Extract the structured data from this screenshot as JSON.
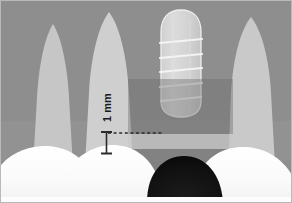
{
  "figure": {
    "name": "dental-periapical-radiograph-illustration",
    "width": 292,
    "height": 203,
    "border_color": "#b9b9b9",
    "background_color": "#ffffff"
  },
  "annotations": {
    "measurement_label": "1 mm",
    "measurement_label_rotation_deg": -90,
    "measurement_label_color": "#1a1a1a",
    "measurement_bar": {
      "name": "vertical-measure-bar",
      "x": 105,
      "y_top": 131,
      "y_bottom": 153,
      "cap_width": 11,
      "color": "#2b2b2b"
    },
    "reference_line": {
      "name": "dashed-reference-line",
      "style": "dashed",
      "x_start": 107,
      "x_end": 161,
      "y": 132,
      "color": "#2b2b2b"
    }
  },
  "anatomy": {
    "background_bone": {
      "name": "alveolar-bone-background",
      "color": "#8e8e8e"
    },
    "tooth_roots": [
      {
        "name": "root-left-outer",
        "color": "#c6c6c6"
      },
      {
        "name": "root-left-inner",
        "color": "#cfcfcf"
      },
      {
        "name": "root-right-outer",
        "color": "#c9c9c9"
      }
    ],
    "crowns": {
      "name": "tooth-crowns-row",
      "color": "#fbfbfb",
      "count": 4
    },
    "dark_dome": {
      "name": "radiolucent-dark-dome",
      "color": "#111111"
    }
  },
  "implant": {
    "name": "dental-implant-fixture",
    "body_color": "#d6d6d6",
    "outline_color": "#efefef",
    "thread_color": "#f2f2f2",
    "thread_count": 5,
    "top_shape": "rounded-dome",
    "x": 159,
    "y": 9,
    "width": 42,
    "height": 105
  },
  "overlays": [
    {
      "name": "graft-region-overlay",
      "shape": "rectangle",
      "color": "#6d6d6d",
      "opacity": 0.42,
      "x": 127,
      "y": 78,
      "width": 105,
      "height": 96
    },
    {
      "name": "bone-level-band-overlay",
      "shape": "rectangle",
      "color": "#e8e8e8",
      "opacity": 0.55,
      "x": 127,
      "y": 133,
      "width": 105,
      "height": 15
    }
  ],
  "colors": {
    "bone": "#8e8e8e",
    "root": "#c9c9c9",
    "crown": "#fbfbfb",
    "implant": "#d6d6d6",
    "dark": "#111111",
    "annotation": "#2b2b2b"
  }
}
